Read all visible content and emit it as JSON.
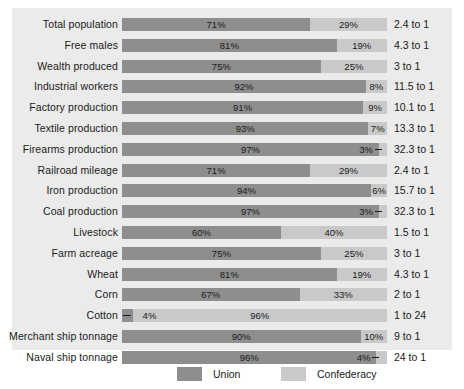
{
  "chart_data": {
    "type": "bar",
    "orientation": "horizontal",
    "stacked": true,
    "normalized": true,
    "title": "",
    "subtitle": "",
    "xlabel": "",
    "ylabel": "",
    "xlim": [
      0,
      100
    ],
    "grid": false,
    "legend_position": "bottom",
    "categories": [
      "Total population",
      "Free males",
      "Wealth produced",
      "Industrial workers",
      "Factory production",
      "Textile production",
      "Firearms production",
      "Railroad mileage",
      "Iron production",
      "Coal production",
      "Livestock",
      "Farm acreage",
      "Wheat",
      "Corn",
      "Cotton",
      "Merchant ship tonnage",
      "Naval ship tonnage"
    ],
    "series": [
      {
        "name": "Union",
        "color": "#8e8e8e",
        "values": [
          71,
          81,
          75,
          92,
          91,
          93,
          97,
          71,
          94,
          97,
          60,
          75,
          81,
          67,
          4,
          90,
          96
        ]
      },
      {
        "name": "Confederacy",
        "color": "#c9c9c9",
        "values": [
          29,
          19,
          25,
          8,
          9,
          7,
          3,
          29,
          6,
          3,
          40,
          25,
          19,
          33,
          96,
          10,
          4
        ]
      }
    ],
    "union_labels": [
      "71%",
      "81%",
      "75%",
      "92%",
      "91%",
      "93%",
      "97%",
      "71%",
      "94%",
      "97%",
      "60%",
      "75%",
      "81%",
      "67%",
      "4%",
      "90%",
      "96%"
    ],
    "confederacy_labels": [
      "29%",
      "19%",
      "25%",
      "8%",
      "9%",
      "7%",
      "3%",
      "29%",
      "6%",
      "3%",
      "40%",
      "25%",
      "19%",
      "33%",
      "96%",
      "10%",
      "4%"
    ],
    "ratios": [
      "2.4 to 1",
      "4.3 to 1",
      "3 to 1",
      "11.5 to 1",
      "10.1 to 1",
      "13.3 to 1",
      "32.3 to 1",
      "2.4 to 1",
      "15.7 to 1",
      "32.3 to 1",
      "1.5 to 1",
      "3 to 1",
      "4.3 to 1",
      "2 to 1",
      "1 to 24",
      "9 to 1",
      "24 to 1"
    ],
    "leader_rows": [
      6,
      9,
      14,
      16
    ],
    "legend": [
      {
        "label": "Union",
        "color": "#8e8e8e"
      },
      {
        "label": "Confederacy",
        "color": "#c9c9c9"
      }
    ]
  },
  "rows": [
    {
      "label": "Total population",
      "union": 71,
      "confederacy": 29,
      "union_label": "71%",
      "confederacy_label": "29%",
      "ratio": "2.4 to 1",
      "leader": "none"
    },
    {
      "label": "Free males",
      "union": 81,
      "confederacy": 19,
      "union_label": "81%",
      "confederacy_label": "19%",
      "ratio": "4.3 to 1",
      "leader": "none"
    },
    {
      "label": "Wealth produced",
      "union": 75,
      "confederacy": 25,
      "union_label": "75%",
      "confederacy_label": "25%",
      "ratio": "3 to 1",
      "leader": "none"
    },
    {
      "label": "Industrial workers",
      "union": 92,
      "confederacy": 8,
      "union_label": "92%",
      "confederacy_label": "8%",
      "ratio": "11.5 to 1",
      "leader": "none"
    },
    {
      "label": "Factory production",
      "union": 91,
      "confederacy": 9,
      "union_label": "91%",
      "confederacy_label": "9%",
      "ratio": "10.1 to 1",
      "leader": "none"
    },
    {
      "label": "Textile production",
      "union": 93,
      "confederacy": 7,
      "union_label": "93%",
      "confederacy_label": "7%",
      "ratio": "13.3 to 1",
      "leader": "none"
    },
    {
      "label": "Firearms production",
      "union": 97,
      "confederacy": 3,
      "union_label": "97%",
      "confederacy_label": "3%",
      "ratio": "32.3 to 1",
      "leader": "right"
    },
    {
      "label": "Railroad mileage",
      "union": 71,
      "confederacy": 29,
      "union_label": "71%",
      "confederacy_label": "29%",
      "ratio": "2.4 to 1",
      "leader": "none"
    },
    {
      "label": "Iron production",
      "union": 94,
      "confederacy": 6,
      "union_label": "94%",
      "confederacy_label": "6%",
      "ratio": "15.7 to 1",
      "leader": "none"
    },
    {
      "label": "Coal production",
      "union": 97,
      "confederacy": 3,
      "union_label": "97%",
      "confederacy_label": "3%",
      "ratio": "32.3 to 1",
      "leader": "right"
    },
    {
      "label": "Livestock",
      "union": 60,
      "confederacy": 40,
      "union_label": "60%",
      "confederacy_label": "40%",
      "ratio": "1.5 to 1",
      "leader": "none"
    },
    {
      "label": "Farm acreage",
      "union": 75,
      "confederacy": 25,
      "union_label": "75%",
      "confederacy_label": "25%",
      "ratio": "3 to 1",
      "leader": "none"
    },
    {
      "label": "Wheat",
      "union": 81,
      "confederacy": 19,
      "union_label": "81%",
      "confederacy_label": "19%",
      "ratio": "4.3 to 1",
      "leader": "none"
    },
    {
      "label": "Corn",
      "union": 67,
      "confederacy": 33,
      "union_label": "67%",
      "confederacy_label": "33%",
      "ratio": "2 to 1",
      "leader": "none"
    },
    {
      "label": "Cotton",
      "union": 4,
      "confederacy": 96,
      "union_label": "4%",
      "confederacy_label": "96%",
      "ratio": "1 to 24",
      "leader": "left"
    },
    {
      "label": "Merchant ship tonnage",
      "union": 90,
      "confederacy": 10,
      "union_label": "90%",
      "confederacy_label": "10%",
      "ratio": "9 to 1",
      "leader": "none"
    },
    {
      "label": "Naval ship tonnage",
      "union": 96,
      "confederacy": 4,
      "union_label": "96%",
      "confederacy_label": "4%",
      "ratio": "24 to 1",
      "leader": "right"
    }
  ],
  "legend": {
    "union": {
      "label": "Union",
      "color": "#8e8e8e"
    },
    "confederacy": {
      "label": "Confederacy",
      "color": "#c9c9c9"
    }
  },
  "colors": {
    "panel_background": "#ebebeb",
    "union": "#8e8e8e",
    "confederacy": "#c9c9c9",
    "text": "#1a1a1a"
  }
}
